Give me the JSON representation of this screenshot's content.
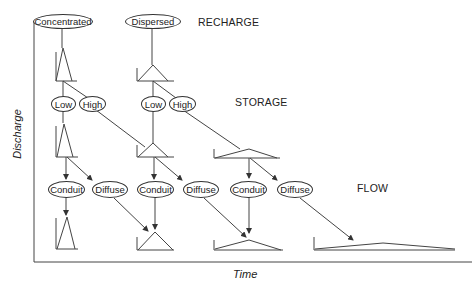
{
  "stages": {
    "recharge": "RECHARGE",
    "storage": "STORAGE",
    "flow": "FLOW"
  },
  "axes": {
    "y_label": "Discharge",
    "x_label": "Time"
  },
  "nodes": {
    "concentrated": "Concentrated",
    "dispersed": "Dispersed",
    "low_1": "Low",
    "high_1": "High",
    "low_2": "Low",
    "high_2": "High",
    "conduit_1": "Conduit",
    "diffuse_1": "Diffuse",
    "conduit_2": "Conduit",
    "diffuse_2": "Diffuse",
    "conduit_3": "Conduit",
    "diffuse_3": "Diffuse"
  },
  "colors": {
    "line": "#333333",
    "background": "#ffffff"
  }
}
